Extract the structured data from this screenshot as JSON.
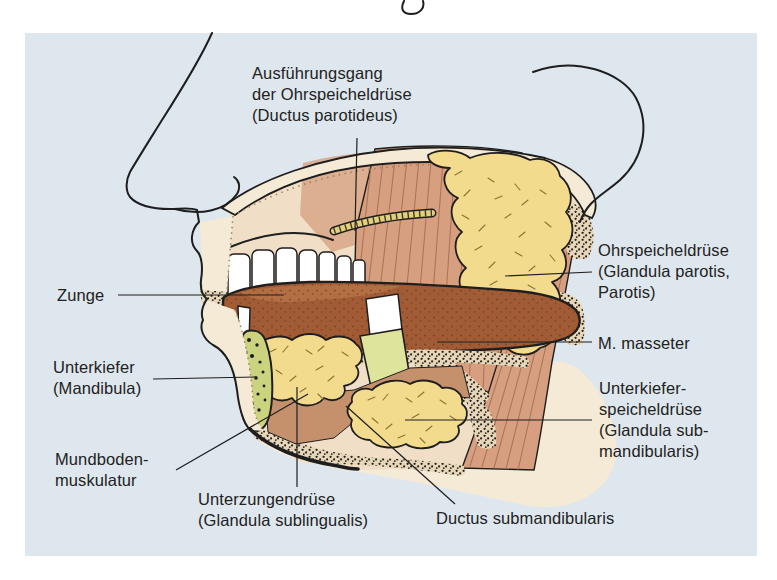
{
  "figure_type": "anatomical-diagram",
  "language": "de",
  "colors": {
    "page_bg": "#ffffff",
    "panel_bg": "#dfe7ee",
    "ink": "#1e1e1e",
    "label_ink": "#222222",
    "skin": "#f5ead6",
    "skin_deep": "#f0dfc6",
    "muscle": "#d79f7f",
    "muscle_line": "#a9765a",
    "muscle_deep": "#c4916c",
    "gland": "#f3db8e",
    "gland_mark": "#8a7434",
    "tongue": "#a25c35",
    "teeth": "#ffffff",
    "bone_speckled": "#ccd37f",
    "bone_cut": "#dfe49d",
    "duct": "#e3cf7c",
    "stipple_base": "#e8d6b8"
  },
  "labels": {
    "ductus_parotideus": {
      "lines": [
        "Ausführungsgang",
        "der Ohrspeicheldrüse",
        "(Ductus parotideus)"
      ]
    },
    "ohrspeicheldruese": {
      "lines": [
        "Ohrspeicheldrüse",
        "(Glandula parotis,",
        "Parotis)"
      ]
    },
    "masseter": {
      "lines": [
        "M. masseter"
      ]
    },
    "unterkieferspeicheldruese": {
      "lines": [
        "Unterkiefer-",
        "speicheldrüse",
        "(Glandula sub-",
        "mandibularis)"
      ]
    },
    "zunge": {
      "lines": [
        "Zunge"
      ]
    },
    "unterkiefer": {
      "lines": [
        "Unterkiefer",
        "(Mandibula)"
      ]
    },
    "mundbodenmuskulatur": {
      "lines": [
        "Mundboden-",
        "muskulatur"
      ]
    },
    "unterzungendruese": {
      "lines": [
        "Unterzungendrüse",
        "(Glandula sublingualis)"
      ]
    },
    "ductus_submandibularis": {
      "lines": [
        "Ductus submandibularis"
      ]
    }
  }
}
